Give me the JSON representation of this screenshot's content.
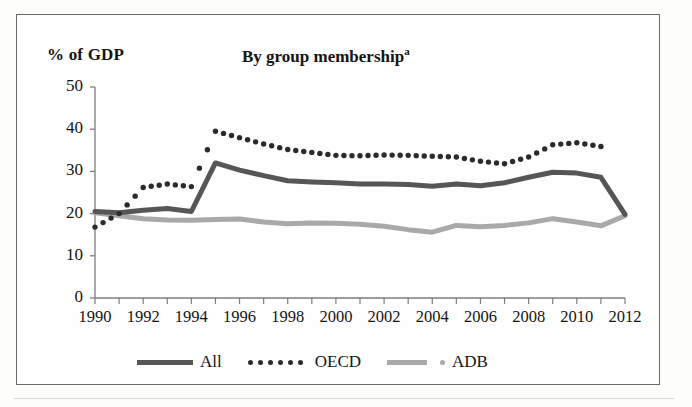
{
  "figure": {
    "y_axis_unit_label": "% of GDP",
    "title": "By group membership",
    "title_footnote_marker": "a"
  },
  "legend": {
    "position": "bottom-center",
    "entries": [
      {
        "label": "All",
        "style": "solid-thick",
        "color": "#565656"
      },
      {
        "label": "OECD",
        "style": "dotted",
        "color": "#2b2b2b"
      },
      {
        "label": "ADB",
        "style": "solid-thick",
        "color": "#a9a9a9"
      }
    ]
  },
  "chart_data": {
    "type": "line",
    "title": "By group membership",
    "subtitle": "",
    "xlabel": "",
    "ylabel": "% of GDP",
    "xlim": [
      1990,
      2012
    ],
    "ylim": [
      0,
      50
    ],
    "ytick_step": 10,
    "yticks": [
      0,
      10,
      20,
      30,
      40,
      50
    ],
    "ytick_labels": [
      "0",
      "10",
      "20",
      "30",
      "40",
      "50"
    ],
    "xticks": [
      1990,
      1992,
      1994,
      1996,
      1998,
      2000,
      2002,
      2004,
      2006,
      2008,
      2010,
      2012
    ],
    "xtick_labels": [
      "1990",
      "1992",
      "1994",
      "1996",
      "1998",
      "2000",
      "2002",
      "2004",
      "2006",
      "2008",
      "2010",
      "2012"
    ],
    "x": [
      1990,
      1991,
      1992,
      1993,
      1994,
      1995,
      1996,
      1997,
      1998,
      1999,
      2000,
      2001,
      2002,
      2003,
      2004,
      2005,
      2006,
      2007,
      2008,
      2009,
      2010,
      2011,
      2012
    ],
    "grid": false,
    "legend_position": "bottom-center",
    "series": [
      {
        "name": "All",
        "style": "solid-thick",
        "color": "#565656",
        "values": [
          20.5,
          20.2,
          20.8,
          21.2,
          20.5,
          32.0,
          30.3,
          29.0,
          27.8,
          27.5,
          27.3,
          27.0,
          27.0,
          26.9,
          26.5,
          27.0,
          26.6,
          27.3,
          28.6,
          29.8,
          29.6,
          28.6,
          19.8
        ]
      },
      {
        "name": "OECD",
        "style": "dotted",
        "color": "#2b2b2b",
        "values": [
          16.8,
          20.0,
          26.2,
          27.0,
          26.4,
          39.5,
          38.0,
          36.5,
          35.2,
          34.5,
          33.8,
          33.7,
          33.9,
          33.8,
          33.6,
          33.4,
          32.4,
          31.8,
          33.4,
          36.3,
          36.8,
          35.9,
          null
        ]
      },
      {
        "name": "ADB",
        "style": "solid-thick",
        "color": "#a9a9a9",
        "values": [
          20.2,
          19.5,
          18.8,
          18.5,
          18.4,
          18.6,
          18.7,
          18.0,
          17.6,
          17.8,
          17.7,
          17.5,
          17.0,
          16.2,
          15.6,
          17.2,
          16.9,
          17.2,
          17.8,
          18.8,
          18.0,
          17.1,
          19.5
        ]
      }
    ]
  }
}
